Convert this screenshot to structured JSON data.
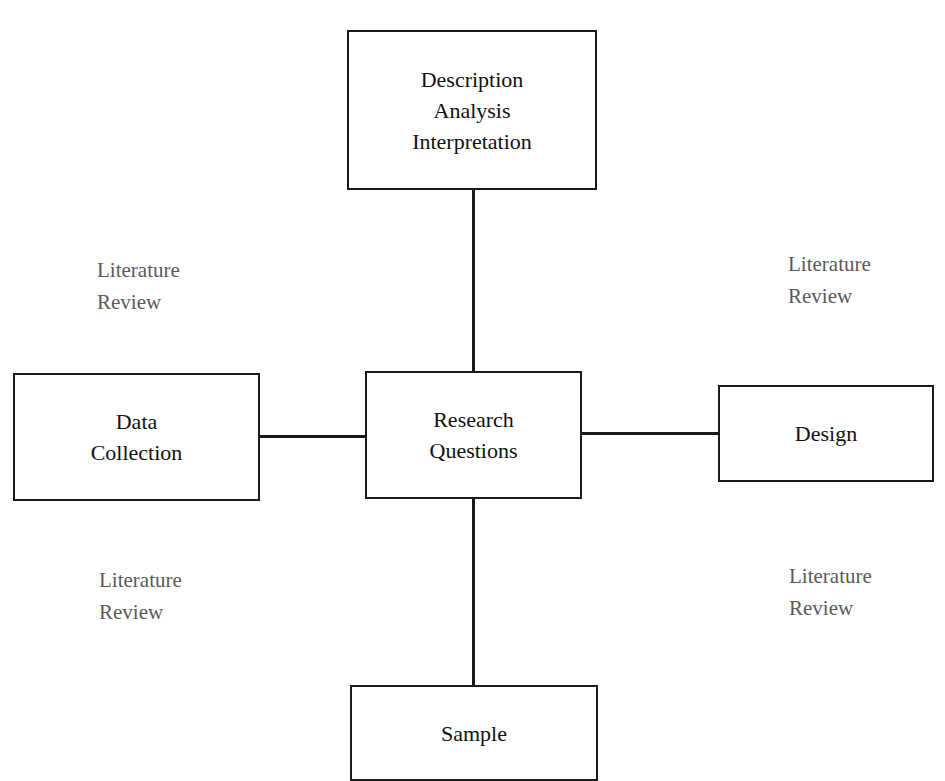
{
  "diagram": {
    "nodes": {
      "top": {
        "lines": [
          "Description",
          "Analysis",
          "Interpretation"
        ]
      },
      "center": {
        "lines": [
          "Research",
          "Questions"
        ]
      },
      "left": {
        "lines": [
          "Data",
          "Collection"
        ]
      },
      "right": {
        "lines": [
          "Design"
        ]
      },
      "bottom": {
        "lines": [
          "Sample"
        ]
      }
    },
    "annotations": {
      "top_left": {
        "lines": [
          "Literature",
          "Review"
        ]
      },
      "top_right": {
        "lines": [
          "Literature",
          "Review"
        ]
      },
      "bottom_left": {
        "lines": [
          "Literature",
          "Review"
        ]
      },
      "bottom_right": {
        "lines": [
          "Literature",
          "Review"
        ]
      }
    },
    "edges": [
      [
        "center",
        "top"
      ],
      [
        "center",
        "left"
      ],
      [
        "center",
        "right"
      ],
      [
        "center",
        "bottom"
      ]
    ]
  }
}
